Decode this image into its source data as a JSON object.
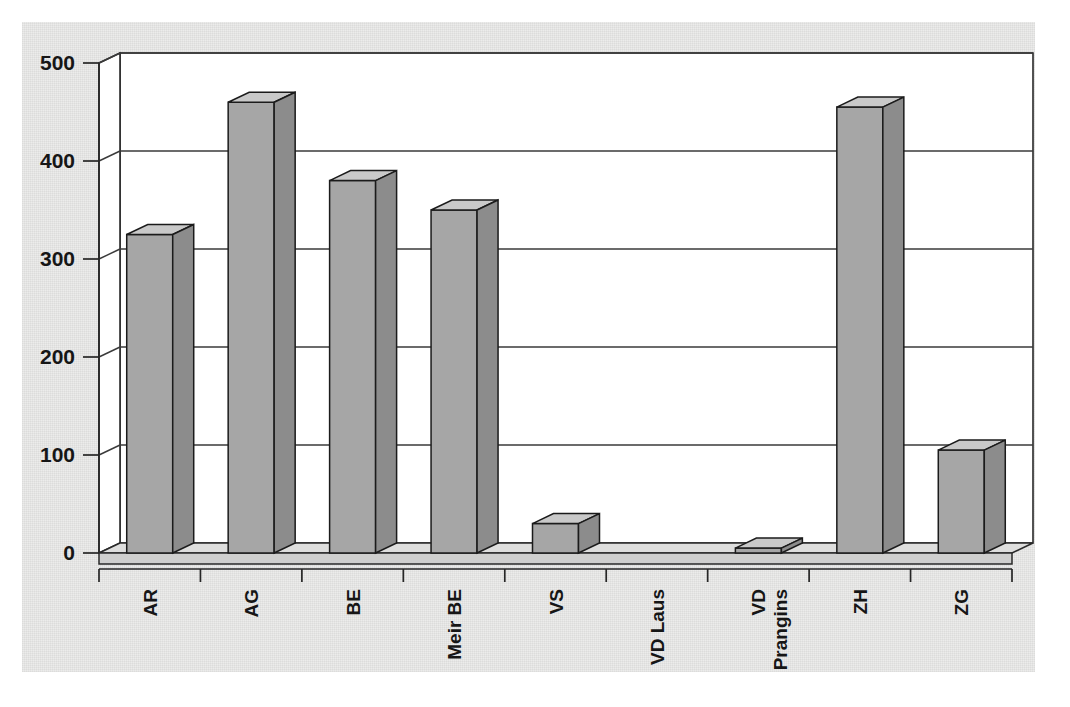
{
  "chart_data": {
    "type": "bar",
    "title": "",
    "subtitle": "",
    "xlabel": "",
    "ylabel": "",
    "categories": [
      "AR",
      "AG",
      "BE",
      "Meir BE",
      "VS",
      "VD Laus",
      "VD Prangins",
      "ZH",
      "ZG"
    ],
    "values": [
      325,
      460,
      380,
      350,
      30,
      0,
      5,
      455,
      105
    ],
    "series": [
      {
        "name": "",
        "values": [
          325,
          460,
          380,
          350,
          30,
          0,
          5,
          455,
          105
        ]
      }
    ],
    "ylim": [
      0,
      500
    ],
    "ytick_labels": [
      "0",
      "100",
      "200",
      "300",
      "400",
      "500"
    ],
    "ytick_values": [
      0,
      100,
      200,
      300,
      400,
      500
    ],
    "grid": true,
    "legend": false,
    "legend_position": "none",
    "style": "3d-column",
    "annotations": []
  },
  "colors": {
    "background": "#ffffff",
    "plot_backdrop": "#ececeb",
    "wall": "#ffffff",
    "bar_front": "#a6a6a6",
    "bar_top": "#c9c9c9",
    "bar_side": "#8c8c8c",
    "floor_top": "#dededd",
    "floor_front": "#cfcfce",
    "gridline": "#3a3a3a",
    "axis": "#262626",
    "text": "#161616"
  }
}
